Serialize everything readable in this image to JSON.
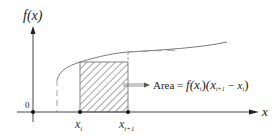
{
  "diagram": {
    "y_axis_label": "f(x)",
    "x_axis_label": "x",
    "origin_label": "0",
    "tick_labels": [
      {
        "base": "x",
        "sub": "i"
      },
      {
        "base": "x",
        "sub": "i+1"
      }
    ],
    "annotation": {
      "prefix": "Area = ",
      "formula_f": "f",
      "formula_arg": "(x",
      "formula_arg_sub": "i",
      "formula_close": ")",
      "formula_paren_open": "(x",
      "formula_sub1": "i+1",
      "formula_minus": " − x",
      "formula_sub2": "i",
      "formula_paren_close": ")"
    },
    "colors": {
      "axis": "#333333",
      "curve": "#7a7a7a",
      "hatch": "#555555",
      "text": "#222222"
    }
  }
}
